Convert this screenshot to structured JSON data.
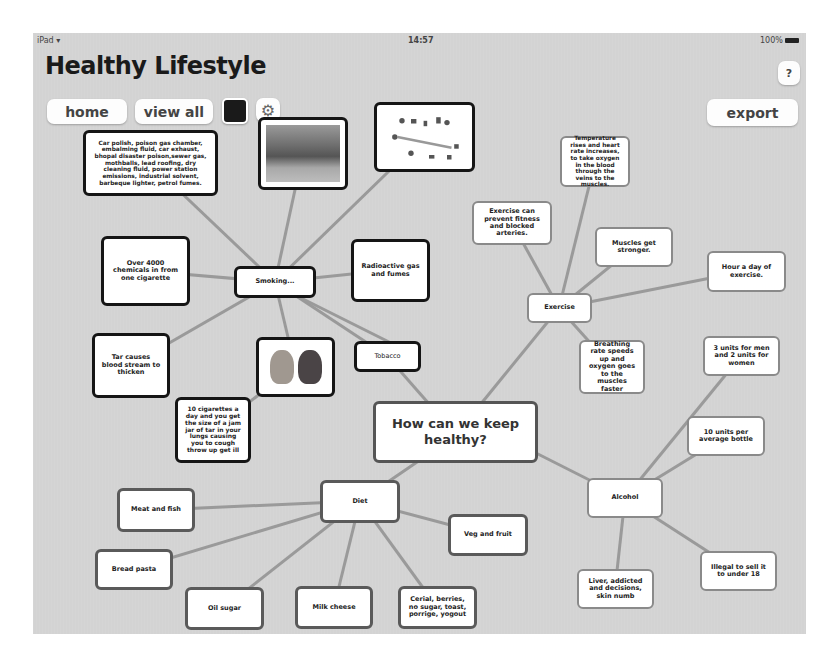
{
  "status_bar": {
    "device": "iPad",
    "time": "14:57",
    "battery": "100%"
  },
  "header": {
    "title": "Healthy Lifestyle"
  },
  "toolbar": {
    "home_label": "home",
    "view_all_label": "view all",
    "help_label": "?",
    "export_label": "export",
    "color_swatch": "#1a1a1a"
  },
  "mindmap": {
    "central": "How can we keep healthy?",
    "smoking": {
      "label": "Smoking...",
      "children": [
        "Car polish, poison gas chamber, embalming fluid, car exhaust, bhopal disaster poison,sewer gas, mothballs, lead roofing, dry cleaning fluid, power station emissions, industrial solvent, barbeque lighter, petrol fumes.",
        "Over 4000 chemicals in from one cigarette",
        "Radioactive gas and fumes",
        "Tar causes blood stream to thicken",
        "10 cigarettes a day and you get the size of a jam jar of tar in your lungs causing you to cough throw up get ill",
        "Tobacco"
      ],
      "images": [
        "factory-photo",
        "chemicals-diagram",
        "lungs-image"
      ]
    },
    "exercise": {
      "label": "Exercise",
      "children": [
        "Temperature rises and heart rate increases, to take oxygen in the blood through the veins to the muscles.",
        "Exercise can prevent fitness and blocked arteries.",
        "Muscles get stronger.",
        "Hour a day of exercise.",
        "Breathing rate speeds up and oxygen goes to the muscles faster"
      ]
    },
    "alcohol": {
      "label": "Alcohol",
      "children": [
        "3 units for men and 2 units for women",
        "10 units per average bottle",
        "Illegal to sell it to under 18",
        "Liver, addicted and decisions, skin numb"
      ]
    },
    "diet": {
      "label": "Diet",
      "children": [
        "Meat and fish",
        "Veg and fruit",
        "Bread pasta",
        "Oil sugar",
        "Milk cheese",
        "Cerial, berries, no sugar, toast, porrige, yogout"
      ]
    }
  },
  "colors": {
    "background": "#d3d3d3",
    "line": "#999999",
    "node_border_dark": "#151515",
    "node_border_light": "#8a8a8a"
  }
}
